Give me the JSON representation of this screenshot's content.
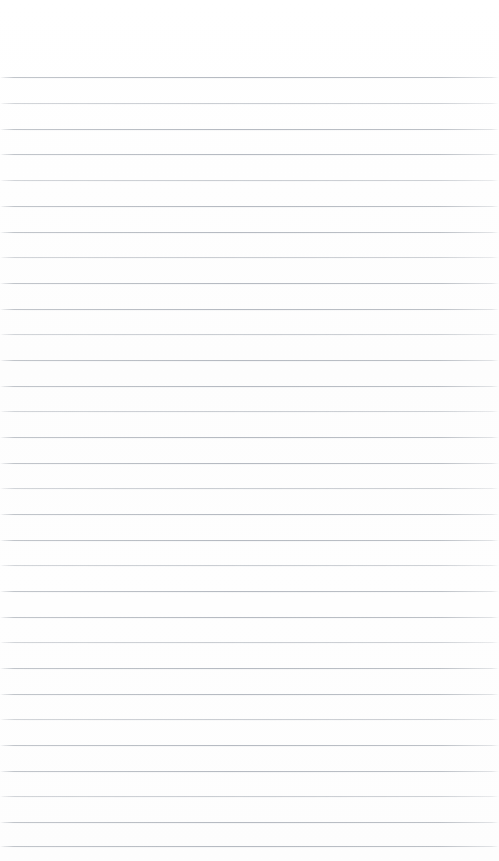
{
  "document": {
    "kind": "lined-paper-page",
    "title": "Blank ruled notebook page",
    "page_width": 499,
    "page_height": 861,
    "background_color": "#fefefe",
    "rule_color": "#b0b5bc",
    "rule_thickness_px": 1,
    "rule_spacing_px": 25.65,
    "first_rule_y": 77,
    "last_rule_y": 846,
    "rule_count": 31,
    "left_margin_px": 2,
    "right_margin_px": 4,
    "top_blank_px": 77,
    "bottom_blank_px": 15,
    "has_margin_rule": false,
    "has_text": false,
    "has_handwriting": false,
    "content_text": ""
  },
  "rules": [
    {
      "index": 1,
      "y": 77,
      "weight": "strong"
    },
    {
      "index": 2,
      "y": 103,
      "weight": "faint"
    },
    {
      "index": 3,
      "y": 129,
      "weight": "strong"
    },
    {
      "index": 4,
      "y": 154,
      "weight": "strong"
    },
    {
      "index": 5,
      "y": 180,
      "weight": "faint"
    },
    {
      "index": 6,
      "y": 206,
      "weight": "strong"
    },
    {
      "index": 7,
      "y": 232,
      "weight": "strong"
    },
    {
      "index": 8,
      "y": 257,
      "weight": "faint"
    },
    {
      "index": 9,
      "y": 283,
      "weight": "strong"
    },
    {
      "index": 10,
      "y": 309,
      "weight": "strong"
    },
    {
      "index": 11,
      "y": 334,
      "weight": "faint"
    },
    {
      "index": 12,
      "y": 360,
      "weight": "strong"
    },
    {
      "index": 13,
      "y": 386,
      "weight": "strong"
    },
    {
      "index": 14,
      "y": 411,
      "weight": "faint"
    },
    {
      "index": 15,
      "y": 437,
      "weight": "strong"
    },
    {
      "index": 16,
      "y": 463,
      "weight": "strong"
    },
    {
      "index": 17,
      "y": 488,
      "weight": "faint"
    },
    {
      "index": 18,
      "y": 514,
      "weight": "strong"
    },
    {
      "index": 19,
      "y": 540,
      "weight": "strong"
    },
    {
      "index": 20,
      "y": 565,
      "weight": "faint"
    },
    {
      "index": 21,
      "y": 591,
      "weight": "strong"
    },
    {
      "index": 22,
      "y": 617,
      "weight": "strong"
    },
    {
      "index": 23,
      "y": 642,
      "weight": "faint"
    },
    {
      "index": 24,
      "y": 668,
      "weight": "strong"
    },
    {
      "index": 25,
      "y": 694,
      "weight": "strong"
    },
    {
      "index": 26,
      "y": 719,
      "weight": "faint"
    },
    {
      "index": 27,
      "y": 745,
      "weight": "strong"
    },
    {
      "index": 28,
      "y": 771,
      "weight": "strong"
    },
    {
      "index": 29,
      "y": 796,
      "weight": "faint"
    },
    {
      "index": 30,
      "y": 822,
      "weight": "strong"
    },
    {
      "index": 31,
      "y": 846,
      "weight": "strong"
    }
  ]
}
